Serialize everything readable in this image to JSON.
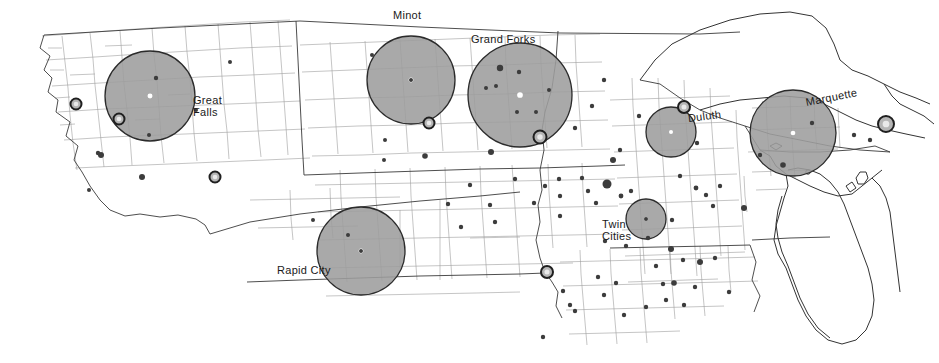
{
  "map": {
    "title": "Upper Midwest regional market areas map",
    "width": 939,
    "height": 363,
    "colors": {
      "background": "#ffffff",
      "county_line": "#9a9a9a",
      "state_line": "#3a3a3a",
      "coastline": "#333333",
      "circle_fill": "#9d9d9d",
      "circle_stroke": "#2b2b2b",
      "circle_center_dot": "#ffffff",
      "ring_fill": "#b5b5b5",
      "ring_stroke": "#1f1f1f",
      "point_marker": "#3c3c3c",
      "label_text": "#1a1a1a"
    },
    "labels": [
      {
        "id": "great-falls",
        "text": "Great\nFalls",
        "x": 193,
        "y": 95,
        "rotation": 0,
        "anchor": "start"
      },
      {
        "id": "minot",
        "text": "Minot",
        "x": 393,
        "y": 10,
        "rotation": 0,
        "anchor": "start"
      },
      {
        "id": "grand-forks",
        "text": "Grand Forks",
        "x": 471,
        "y": 34,
        "rotation": 0,
        "anchor": "start"
      },
      {
        "id": "duluth",
        "text": "Duluth",
        "x": 688,
        "y": 113,
        "rotation": -7,
        "anchor": "start"
      },
      {
        "id": "marquette",
        "text": "Marquette",
        "x": 806,
        "y": 97,
        "rotation": -11,
        "anchor": "start"
      },
      {
        "id": "rapid-city",
        "text": "Rapid City",
        "x": 277,
        "y": 265,
        "rotation": 0,
        "anchor": "start"
      },
      {
        "id": "twin-cities",
        "text": "Twin\nCities",
        "x": 602,
        "y": 219,
        "rotation": 0,
        "anchor": "start"
      }
    ],
    "market_circles": [
      {
        "id": "great-falls",
        "city": "Great Falls",
        "cx": 150,
        "cy": 96,
        "r": 45
      },
      {
        "id": "minot",
        "city": "Minot",
        "cx": 411,
        "cy": 80,
        "r": 44
      },
      {
        "id": "grand-forks",
        "city": "Grand Forks",
        "cx": 520,
        "cy": 95,
        "r": 52
      },
      {
        "id": "duluth",
        "city": "Duluth",
        "cx": 671,
        "cy": 132,
        "r": 25
      },
      {
        "id": "marquette",
        "city": "Marquette",
        "cx": 793,
        "cy": 133,
        "r": 43
      },
      {
        "id": "rapid-city",
        "city": "Rapid City",
        "cx": 361,
        "cy": 251,
        "r": 44
      },
      {
        "id": "twin-cities",
        "city": "Twin Cities",
        "cx": 646,
        "cy": 219,
        "r": 20
      }
    ],
    "ring_markers": [
      {
        "id": "ring-w-montana",
        "cx": 76,
        "cy": 104,
        "r": 5.5
      },
      {
        "id": "ring-great-falls-sw",
        "cx": 119,
        "cy": 119,
        "r": 5.5
      },
      {
        "id": "ring-s-montana",
        "cx": 215,
        "cy": 177,
        "r": 5.5
      },
      {
        "id": "ring-minot-s",
        "cx": 429,
        "cy": 123,
        "r": 5.5
      },
      {
        "id": "ring-fargo",
        "cx": 540,
        "cy": 137,
        "r": 6.5
      },
      {
        "id": "ring-duluth",
        "cx": 684,
        "cy": 107,
        "r": 6.0
      },
      {
        "id": "ring-sioux-city",
        "cx": 547,
        "cy": 272,
        "r": 6.0
      },
      {
        "id": "ring-sault",
        "cx": 886,
        "cy": 124,
        "r": 8.0
      }
    ],
    "point_markers": [
      {
        "x": 156,
        "y": 78,
        "s": 2.2
      },
      {
        "x": 149,
        "y": 135,
        "s": 2.0
      },
      {
        "x": 196,
        "y": 110,
        "s": 2.0
      },
      {
        "x": 230,
        "y": 62,
        "s": 2.0
      },
      {
        "x": 101,
        "y": 155,
        "s": 3.0
      },
      {
        "x": 142,
        "y": 177,
        "s": 3.0
      },
      {
        "x": 89,
        "y": 190,
        "s": 2.0
      },
      {
        "x": 98,
        "y": 153,
        "s": 2.2
      },
      {
        "x": 372,
        "y": 55,
        "s": 2.0
      },
      {
        "x": 411,
        "y": 80,
        "s": 2.0
      },
      {
        "x": 385,
        "y": 140,
        "s": 2.0
      },
      {
        "x": 384,
        "y": 160,
        "s": 2.0
      },
      {
        "x": 425,
        "y": 156,
        "s": 2.8
      },
      {
        "x": 500,
        "y": 68,
        "s": 3.2
      },
      {
        "x": 519,
        "y": 72,
        "s": 2.2
      },
      {
        "x": 496,
        "y": 86,
        "s": 2.0
      },
      {
        "x": 486,
        "y": 88,
        "s": 2.0
      },
      {
        "x": 549,
        "y": 90,
        "s": 2.0
      },
      {
        "x": 517,
        "y": 112,
        "s": 2.0
      },
      {
        "x": 536,
        "y": 112,
        "s": 2.0
      },
      {
        "x": 491,
        "y": 152,
        "s": 3.0
      },
      {
        "x": 575,
        "y": 128,
        "s": 2.2
      },
      {
        "x": 592,
        "y": 106,
        "s": 2.2
      },
      {
        "x": 604,
        "y": 80,
        "s": 2.2
      },
      {
        "x": 620,
        "y": 150,
        "s": 2.2
      },
      {
        "x": 613,
        "y": 160,
        "s": 3.0
      },
      {
        "x": 582,
        "y": 178,
        "s": 2.2
      },
      {
        "x": 607,
        "y": 184,
        "s": 4.5
      },
      {
        "x": 588,
        "y": 191,
        "s": 2.2
      },
      {
        "x": 596,
        "y": 203,
        "s": 2.2
      },
      {
        "x": 621,
        "y": 196,
        "s": 2.4
      },
      {
        "x": 631,
        "y": 191,
        "s": 2.2
      },
      {
        "x": 560,
        "y": 196,
        "s": 2.2
      },
      {
        "x": 560,
        "y": 216,
        "s": 2.2
      },
      {
        "x": 646,
        "y": 219,
        "s": 2.0
      },
      {
        "x": 672,
        "y": 220,
        "s": 2.2
      },
      {
        "x": 648,
        "y": 238,
        "s": 2.2
      },
      {
        "x": 605,
        "y": 241,
        "s": 2.2
      },
      {
        "x": 626,
        "y": 246,
        "s": 2.2
      },
      {
        "x": 671,
        "y": 249,
        "s": 3.0
      },
      {
        "x": 680,
        "y": 176,
        "s": 2.2
      },
      {
        "x": 697,
        "y": 143,
        "s": 2.2
      },
      {
        "x": 696,
        "y": 188,
        "s": 2.4
      },
      {
        "x": 706,
        "y": 195,
        "s": 2.2
      },
      {
        "x": 713,
        "y": 206,
        "s": 2.2
      },
      {
        "x": 720,
        "y": 186,
        "s": 2.2
      },
      {
        "x": 744,
        "y": 208,
        "s": 3.0
      },
      {
        "x": 683,
        "y": 260,
        "s": 2.2
      },
      {
        "x": 700,
        "y": 262,
        "s": 3.0
      },
      {
        "x": 674,
        "y": 283,
        "s": 2.8
      },
      {
        "x": 656,
        "y": 266,
        "s": 2.2
      },
      {
        "x": 715,
        "y": 258,
        "s": 2.2
      },
      {
        "x": 639,
        "y": 116,
        "s": 2.2
      },
      {
        "x": 313,
        "y": 220,
        "s": 2.0
      },
      {
        "x": 348,
        "y": 235,
        "s": 2.0
      },
      {
        "x": 361,
        "y": 251,
        "s": 2.0
      },
      {
        "x": 495,
        "y": 222,
        "s": 2.2
      },
      {
        "x": 563,
        "y": 291,
        "s": 2.2
      },
      {
        "x": 575,
        "y": 311,
        "s": 2.2
      },
      {
        "x": 598,
        "y": 277,
        "s": 2.2
      },
      {
        "x": 604,
        "y": 295,
        "s": 2.2
      },
      {
        "x": 616,
        "y": 283,
        "s": 2.2
      },
      {
        "x": 570,
        "y": 305,
        "s": 2.2
      },
      {
        "x": 543,
        "y": 337,
        "s": 2.2
      },
      {
        "x": 646,
        "y": 307,
        "s": 2.2
      },
      {
        "x": 624,
        "y": 315,
        "s": 2.2
      },
      {
        "x": 666,
        "y": 300,
        "s": 2.2
      },
      {
        "x": 684,
        "y": 305,
        "s": 2.2
      },
      {
        "x": 695,
        "y": 287,
        "s": 2.2
      },
      {
        "x": 729,
        "y": 292,
        "s": 2.2
      },
      {
        "x": 663,
        "y": 284,
        "s": 2.2
      },
      {
        "x": 760,
        "y": 155,
        "s": 2.2
      },
      {
        "x": 783,
        "y": 165,
        "s": 2.8
      },
      {
        "x": 812,
        "y": 123,
        "s": 2.2
      },
      {
        "x": 870,
        "y": 140,
        "s": 2.2
      },
      {
        "x": 854,
        "y": 135,
        "s": 2.2
      },
      {
        "x": 470,
        "y": 185,
        "s": 2.2
      },
      {
        "x": 515,
        "y": 179,
        "s": 2.2
      },
      {
        "x": 448,
        "y": 204,
        "s": 2.2
      },
      {
        "x": 490,
        "y": 205,
        "s": 2.2
      },
      {
        "x": 461,
        "y": 227,
        "s": 2.2
      },
      {
        "x": 534,
        "y": 203,
        "s": 2.2
      },
      {
        "x": 545,
        "y": 186,
        "s": 2.2
      },
      {
        "x": 559,
        "y": 179,
        "s": 2.2
      }
    ]
  }
}
